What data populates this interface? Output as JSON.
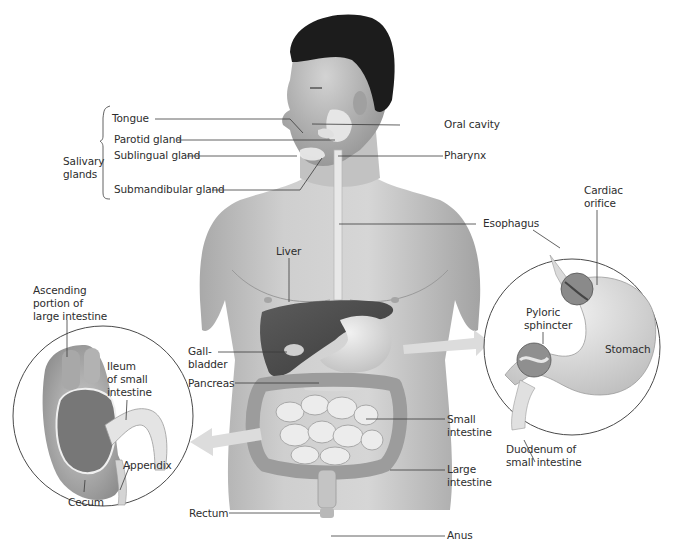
{
  "figure": {
    "labels": {
      "tongue": "Tongue",
      "parotid_gland": "Parotid gland",
      "sublingual_gland": "Sublingual gland",
      "submandibular_gland": "Submandibular gland",
      "salivary_glands_line1": "Salivary",
      "salivary_glands_line2": "glands",
      "oral_cavity": "Oral cavity",
      "pharynx": "Pharynx",
      "esophagus": "Esophagus",
      "cardiac_orifice_line1": "Cardiac",
      "cardiac_orifice_line2": "orifice",
      "pyloric_sphincter_line1": "Pyloric",
      "pyloric_sphincter_line2": "sphincter",
      "stomach": "Stomach",
      "duodenum_line1": "Duodenum of",
      "duodenum_line2": "small intestine",
      "liver": "Liver",
      "gallbladder_line1": "Gall-",
      "gallbladder_line2": "bladder",
      "pancreas": "Pancreas",
      "small_intestine_line1": "Small",
      "small_intestine_line2": "intestine",
      "large_intestine_line1": "Large",
      "large_intestine_line2": "intestine",
      "rectum": "Rectum",
      "anus": "Anus",
      "ascending_line1": "Ascending",
      "ascending_line2": "portion of",
      "ascending_line3": "large intestine",
      "ileum_line1": "Ileum",
      "ileum_line2": "of small",
      "ileum_line3": "intestine",
      "appendix": "Appendix",
      "cecum": "Cecum"
    },
    "colors": {
      "background": "#ffffff",
      "skin": "#c9c9c9",
      "hair": "#1c1c1c",
      "liver": "#4a4a4a",
      "organ_light": "#e6e6e6",
      "leader_line": "#3a3a3a",
      "arrow": "#d8d8d8",
      "text": "#2d2d2d"
    }
  }
}
